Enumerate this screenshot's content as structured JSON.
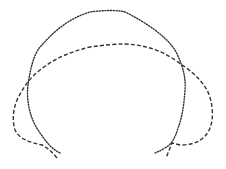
{
  "figure": {
    "background": "#ffffff",
    "curves": [
      {
        "name": "dotted-outline",
        "style": "dotted",
        "color": "#333333",
        "path": "M60,153 C50,148 45,140 38,130 C30,118 26,100 28,85 C30,70 34,52 42,45 C55,30 70,18 90,12 C105,10 118,10 125,12 C145,22 165,35 175,50 C183,65 186,78 185,90 C184,105 182,118 178,128 C175,138 172,144 165,148 C160,151 157,152 155,153"
      },
      {
        "name": "dashed-outline",
        "style": "dashed",
        "color": "#333333",
        "path": "M57,158 C52,152 48,148 42,145 C30,142 20,140 15,130 C12,120 13,108 18,98 C24,86 30,78 40,70 C55,58 70,52 90,47 C105,45 115,44 125,44 C145,45 160,50 175,60 C190,70 200,78 207,90 C213,102 214,118 210,128 C205,140 195,145 180,145 C175,144 174,143 172,143 C170,148 168,153 166,158"
      }
    ]
  }
}
